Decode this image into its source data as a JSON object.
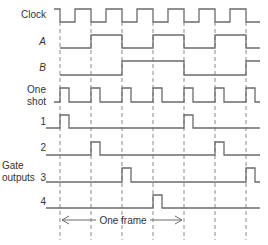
{
  "diagram": {
    "colors": {
      "wave": "#6b6b6b",
      "dash": "#8a8a8a",
      "text": "#333333"
    },
    "dash_lines_x": [
      60,
      91,
      122,
      153,
      184,
      215,
      246
    ],
    "signals": [
      {
        "id": "clock",
        "label": "Clock",
        "italic": false,
        "high_y": 9,
        "low_y": 22,
        "points": "M 54 9 L 60 9 L 60 22 L 75 22 L 75 9 L 91 9 L 91 22 L 106 22 L 106 9 L 122 9 L 122 22 L 137 22 L 137 9 L 153 9 L 153 22 L 168 22 L 168 9 L 184 9 L 184 22 L 199 22 L 199 9 L 215 9 L 215 22 L 230 22 L 230 9 L 246 9 L 246 22 L 260 22"
      },
      {
        "id": "A",
        "label": "A",
        "italic": true,
        "high_y": 35,
        "low_y": 48,
        "points": "M 60 48 L 91 48 L 91 35 L 122 35 L 122 48 L 153 48 L 153 35 L 184 35 L 184 48 L 215 48 L 215 35 L 246 35 L 246 48 L 260 48"
      },
      {
        "id": "B",
        "label": "B",
        "italic": true,
        "high_y": 61,
        "low_y": 75,
        "points": "M 60 75 L 122 75 L 122 61 L 184 61 L 184 75 L 246 75 L 246 61 L 260 61"
      },
      {
        "id": "one-shot",
        "label": "One shot",
        "label_lines": [
          "One",
          "shot"
        ],
        "italic": false,
        "high_y": 88,
        "low_y": 102,
        "points": "M 54 102 L 60 102 L 60 88 L 69 88 L 69 102 L 91 102 L 91 88 L 100 88 L 100 102 L 122 102 L 122 88 L 131 88 L 131 102 L 153 102 L 153 88 L 162 88 L 162 102 L 184 102 L 184 88 L 193 88 L 193 102 L 215 102 L 215 88 L 224 88 L 224 102 L 246 102 L 246 88 L 255 88 L 255 102 L 260 102"
      },
      {
        "id": "gate-1",
        "label": "1",
        "italic": false,
        "high_y": 115,
        "low_y": 128,
        "points": "M 46 128 L 60 128 L 60 115 L 69 115 L 69 128 L 184 128 L 184 115 L 193 115 L 193 128 L 260 128"
      },
      {
        "id": "gate-2",
        "label": "2",
        "italic": false,
        "high_y": 142,
        "low_y": 155,
        "points": "M 46 155 L 91 155 L 91 142 L 100 142 L 100 155 L 215 155 L 215 142 L 224 142 L 224 155 L 260 155"
      },
      {
        "id": "gate-3",
        "label": "3",
        "italic": false,
        "high_y": 168,
        "low_y": 182,
        "points": "M 46 182 L 122 182 L 122 168 L 131 168 L 131 182 L 246 182 L 246 168 L 255 168 L 255 182 L 260 182"
      },
      {
        "id": "gate-4",
        "label": "4",
        "italic": false,
        "high_y": 195,
        "low_y": 208,
        "points": "M 46 208 L 153 208 L 153 195 L 162 195 L 162 208 L 260 208"
      }
    ],
    "group_label": {
      "lines": [
        "Gate",
        "outputs"
      ]
    },
    "frame_annotation": {
      "label": "One frame",
      "x_start": 60,
      "x_end": 184,
      "y": 220
    }
  }
}
